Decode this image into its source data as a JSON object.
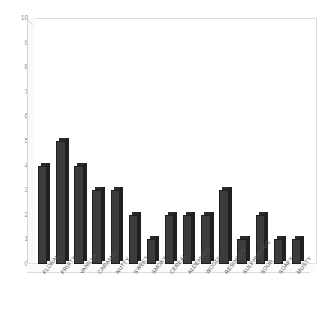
{
  "chart_data": {
    "type": "bar",
    "title": "",
    "subtitle": "",
    "xlabel": "",
    "ylabel": "",
    "categories": [
      "FLORAL",
      "FRUITY",
      "VANILLA",
      "CARAMEL",
      "NUTTY",
      "SWEET",
      "SMOKY",
      "CEREAL",
      "ALDEHYDIC",
      "WOODY",
      "RESINOUS",
      "SULPHUROUS",
      "SOUR",
      "SOAPY",
      "MUSTY"
    ],
    "values": [
      4,
      5,
      4,
      3,
      3,
      2,
      1,
      2,
      2,
      2,
      3,
      1,
      2,
      1,
      1
    ],
    "ylim": [
      0,
      10
    ],
    "ytick_labels": [
      "0",
      "1",
      "2",
      "3",
      "4",
      "5",
      "6",
      "7",
      "8",
      "9",
      "10"
    ],
    "grid": false,
    "legend": "none",
    "style": "3d-column",
    "bar_color": "#3c3c3c",
    "bar_side_color": "#202020",
    "axis_text_color": "#8a8a8a",
    "label_text_color": "#555555",
    "frame_color": "#dcdcdc",
    "background": "#ffffff"
  }
}
